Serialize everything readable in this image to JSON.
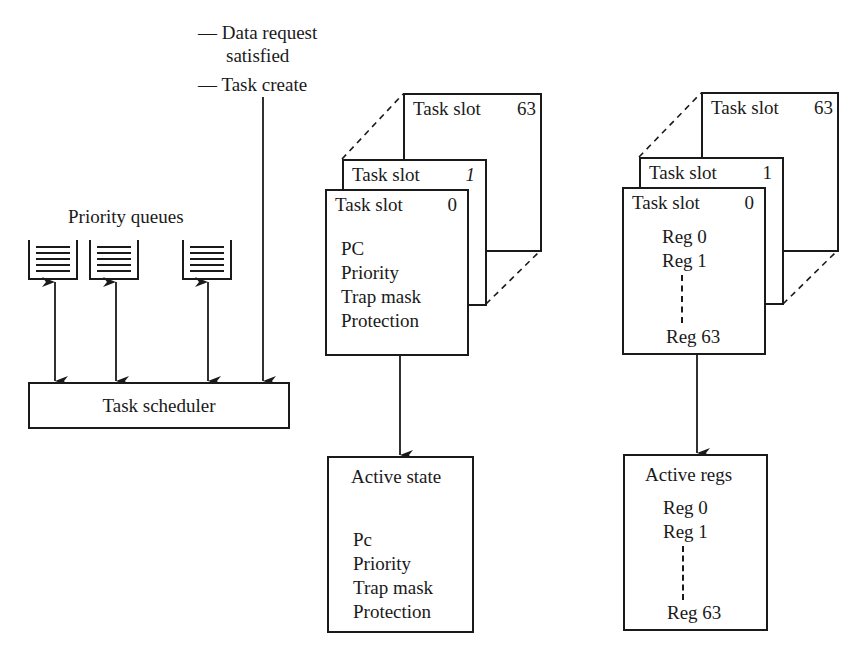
{
  "events": {
    "data_request_line1": "— Data request",
    "data_request_line2": "satisfied",
    "task_create": "— Task create"
  },
  "priority_queues": {
    "label": "Priority queues",
    "queues": [
      {
        "name": "queue-1"
      },
      {
        "name": "queue-2"
      },
      {
        "name": "queue-3"
      }
    ]
  },
  "scheduler": {
    "label": "Task scheduler"
  },
  "state_slots": {
    "slots": [
      {
        "title": "Task slot",
        "number": "63"
      },
      {
        "title": "Task slot",
        "number": "1"
      },
      {
        "title": "Task slot",
        "number": "0"
      }
    ],
    "fields": [
      "PC",
      "Priority",
      "Trap mask",
      "Protection"
    ]
  },
  "active_state": {
    "title": "Active state",
    "fields": [
      "Pc",
      "Priority",
      "Trap mask",
      "Protection"
    ]
  },
  "register_slots": {
    "slots": [
      {
        "title": "Task slot",
        "number": "63"
      },
      {
        "title": "Task slot",
        "number": "1"
      },
      {
        "title": "Task slot",
        "number": "0"
      }
    ],
    "regs": [
      "Reg 0",
      "Reg 1",
      "Reg 63"
    ]
  },
  "active_regs": {
    "title": "Active regs",
    "regs": [
      "Reg 0",
      "Reg 1",
      "Reg 63"
    ]
  },
  "colors": {
    "ink": "#1a1a1a",
    "background": "#ffffff"
  }
}
